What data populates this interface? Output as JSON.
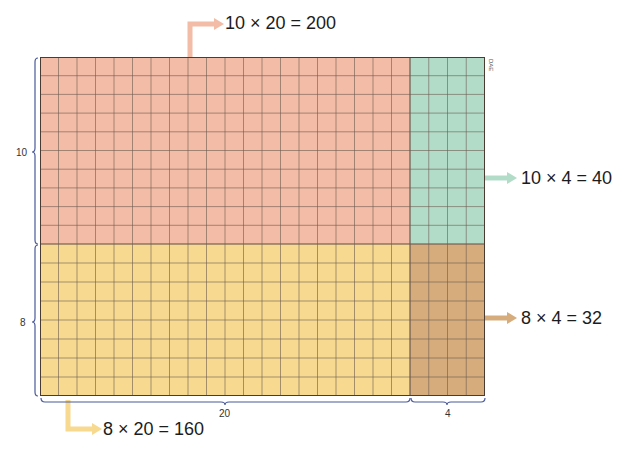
{
  "diagram": {
    "type": "area-model-multiplication",
    "dimensions": {
      "rows": [
        10,
        8
      ],
      "cols": [
        20,
        4
      ]
    },
    "regions": [
      {
        "id": "top-left",
        "rows": 10,
        "cols": 20,
        "product": 200,
        "color": "#f2bca6",
        "label": "10 × 20 = 200"
      },
      {
        "id": "top-right",
        "rows": 10,
        "cols": 4,
        "product": 40,
        "color": "#b3dcc8",
        "label": "10 × 4 = 40"
      },
      {
        "id": "bottom-left",
        "rows": 8,
        "cols": 20,
        "product": 160,
        "color": "#f7d98f",
        "label": "8 × 20 = 160"
      },
      {
        "id": "bottom-right",
        "rows": 8,
        "cols": 4,
        "product": 32,
        "color": "#d6ac7c",
        "label": "8 × 4 = 32"
      }
    ],
    "side_labels": {
      "left_top": "10",
      "left_bottom": "8",
      "bottom_left": "20",
      "bottom_right": "4"
    },
    "credit": "DAE",
    "colors": {
      "grid_line": "#6b5a50",
      "brace": "#4a5a9a",
      "arrow_top_left": "#f2bca6",
      "arrow_top_right": "#b3dcc8",
      "arrow_bottom_left": "#f7d98f",
      "arrow_bottom_right": "#d6ac7c"
    }
  }
}
